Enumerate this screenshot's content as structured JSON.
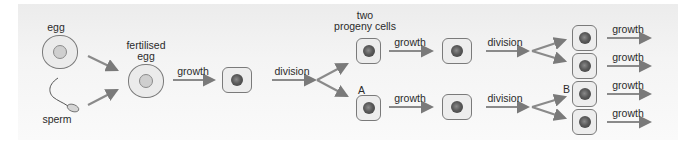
{
  "diagram": {
    "colors": {
      "background": "#f2f2f2",
      "arrow": "#7a7a7a",
      "cell_fill": "#ebebeb",
      "cell_border": "#7a7a7a",
      "nucleus": "#555555",
      "text": "#2b2b2b"
    },
    "labels": {
      "egg": "egg",
      "sperm": "sperm",
      "fertilised_egg_line1": "fertilised",
      "fertilised_egg_line2": "egg",
      "growth_1": "growth",
      "division_1": "division",
      "two_progeny_line1": "two",
      "two_progeny_line2": "progeny cells",
      "growth_top": "growth",
      "growth_bottom": "growth",
      "label_a": "A",
      "division_top": "division",
      "division_bottom": "division",
      "label_b": "B",
      "growth_final_1": "growth",
      "growth_final_2": "growth",
      "growth_final_3": "growth",
      "growth_final_4": "growth"
    },
    "nodes": [
      {
        "id": "egg",
        "type": "round-cell"
      },
      {
        "id": "sperm",
        "type": "sperm"
      },
      {
        "id": "fertilised-egg",
        "type": "round-cell"
      },
      {
        "id": "grown-cell",
        "type": "cell"
      },
      {
        "id": "progeny-top",
        "type": "cell"
      },
      {
        "id": "progeny-bottom-A",
        "type": "cell"
      },
      {
        "id": "grown-top",
        "type": "cell"
      },
      {
        "id": "grown-bottom",
        "type": "cell"
      },
      {
        "id": "final-1",
        "type": "cell"
      },
      {
        "id": "final-2",
        "type": "cell"
      },
      {
        "id": "final-3-B",
        "type": "cell"
      },
      {
        "id": "final-4",
        "type": "cell"
      }
    ]
  }
}
